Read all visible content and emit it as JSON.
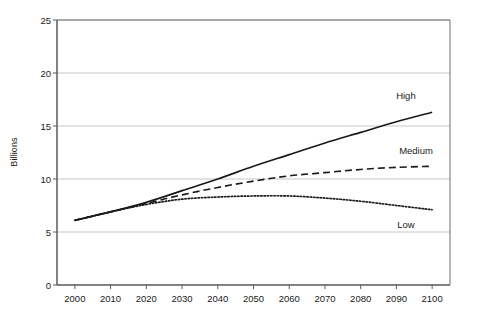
{
  "chart_data": {
    "type": "line",
    "title": "",
    "xlabel": "",
    "ylabel": "Billions",
    "xlim": [
      1995,
      2105
    ],
    "ylim": [
      0,
      25
    ],
    "grid": true,
    "legend_position": "inline-annotations",
    "x": [
      2000,
      2010,
      2020,
      2030,
      2040,
      2050,
      2060,
      2070,
      2080,
      2090,
      2100
    ],
    "xticks": [
      "2000",
      "2010",
      "2020",
      "2030",
      "2040",
      "2050",
      "2060",
      "2070",
      "2080",
      "2090",
      "2100"
    ],
    "yticks": [
      "0",
      "5",
      "10",
      "15",
      "20",
      "25"
    ],
    "ytick_values": [
      0,
      5,
      10,
      15,
      20,
      25
    ],
    "series": [
      {
        "name": "High",
        "style": "solid",
        "color": "#1a1a1a",
        "label": "High",
        "values": [
          6.1,
          6.9,
          7.8,
          8.9,
          10.0,
          11.2,
          12.3,
          13.4,
          14.4,
          15.4,
          16.3
        ]
      },
      {
        "name": "Medium",
        "style": "dashed",
        "color": "#1a1a1a",
        "label": "Medium",
        "values": [
          6.1,
          6.9,
          7.7,
          8.5,
          9.2,
          9.8,
          10.3,
          10.6,
          10.9,
          11.1,
          11.2
        ]
      },
      {
        "name": "Low",
        "style": "dotted",
        "color": "#1a1a1a",
        "label": "Low",
        "values": [
          6.1,
          6.9,
          7.6,
          8.1,
          8.3,
          8.4,
          8.4,
          8.2,
          7.9,
          7.5,
          7.1
        ]
      }
    ]
  },
  "annotations": {
    "high_label": "High",
    "medium_label": "Medium",
    "low_label": "Low"
  },
  "axis": {
    "y_title": "Billions"
  }
}
